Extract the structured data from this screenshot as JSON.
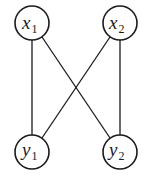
{
  "diagram": {
    "type": "bipartite-graph",
    "nodes": [
      {
        "id": "x1",
        "var": "x",
        "sub": "1",
        "cx": 32,
        "cy": 23
      },
      {
        "id": "x2",
        "var": "x",
        "sub": "2",
        "cx": 120,
        "cy": 23
      },
      {
        "id": "y1",
        "var": "y",
        "sub": "1",
        "cx": 32,
        "cy": 152
      },
      {
        "id": "y2",
        "var": "y",
        "sub": "2",
        "cx": 120,
        "cy": 152
      }
    ],
    "edges": [
      {
        "from": "x1",
        "to": "y1"
      },
      {
        "from": "x1",
        "to": "y2"
      },
      {
        "from": "x2",
        "to": "y1"
      },
      {
        "from": "x2",
        "to": "y2"
      }
    ],
    "node_radius": 17,
    "stroke_color": "#1a1a1a",
    "background": "#ffffff"
  }
}
